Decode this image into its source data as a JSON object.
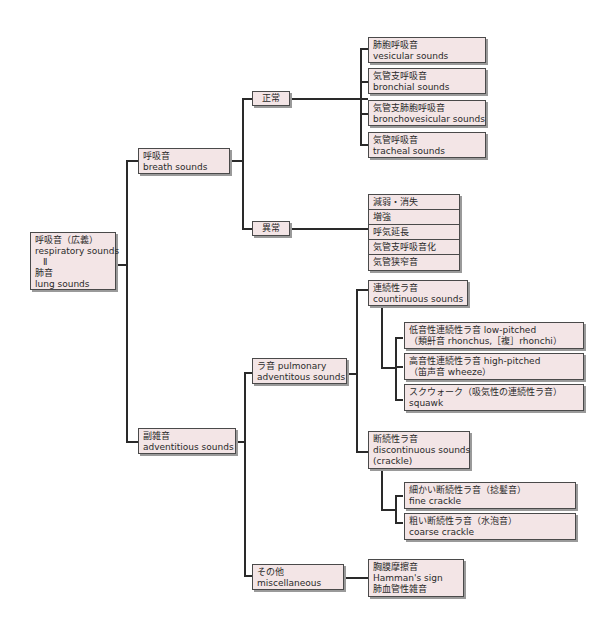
{
  "root": {
    "lines": [
      "呼吸音（広義）",
      "respiratory sounds",
      "Ⅱ",
      "肺音",
      "lung sounds"
    ]
  },
  "breath": {
    "lines": [
      "呼吸音",
      "breath sounds"
    ]
  },
  "normal": {
    "label": "正常"
  },
  "normal_items": [
    {
      "lines": [
        "肺胞呼吸音",
        "vesicular sounds"
      ]
    },
    {
      "lines": [
        "気管支呼吸音",
        "bronchial sounds"
      ]
    },
    {
      "lines": [
        "気管支肺胞呼吸音",
        "bronchovesicular sounds"
      ]
    },
    {
      "lines": [
        "気管呼吸音",
        "tracheal sounds"
      ]
    }
  ],
  "abnormal": {
    "label": "異常"
  },
  "abnormal_items": [
    "減弱・消失",
    "増強",
    "呼気延長",
    "気管支呼吸音化",
    "気管狭窄音"
  ],
  "adventitious": {
    "lines": [
      "副雑音",
      "adventitious sounds"
    ]
  },
  "rales": {
    "lines": [
      "ラ音 pulmonary",
      "adventitous sounds"
    ]
  },
  "continuous": {
    "lines": [
      "連続性ラ音",
      "countinuous sounds"
    ]
  },
  "continuous_items": [
    {
      "lines": [
        "低音性連続性ラ音 low-pitched",
        "（類鼾音 rhonchus,［複］rhonchi）"
      ]
    },
    {
      "lines": [
        "高音性連続性ラ音 high-pitched",
        "（笛声音 wheeze）"
      ]
    },
    {
      "lines": [
        "スクウォーク（吸気性の連続性ラ音）",
        "squawk"
      ]
    }
  ],
  "discontinuous": {
    "lines": [
      "断続性ラ音",
      "discontinuous sounds",
      "(crackle)"
    ]
  },
  "discontinuous_items": [
    {
      "lines": [
        "細かい断続性ラ音（捻髪音）",
        "fine crackle"
      ]
    },
    {
      "lines": [
        "粗い断続性ラ音（水泡音）",
        "coarse crackle"
      ]
    }
  ],
  "misc": {
    "lines": [
      "その他",
      "miscellaneous"
    ]
  },
  "misc_items": {
    "lines": [
      "胸膜摩擦音",
      "Hamman's sign",
      "肺血管性雑音"
    ]
  }
}
